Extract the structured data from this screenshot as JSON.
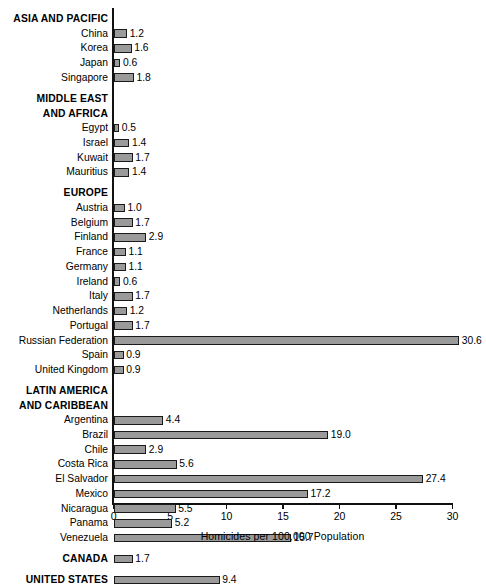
{
  "chart_data": {
    "type": "bar",
    "orientation": "horizontal",
    "title": "",
    "xlabel": "Homicides per 100,000 Population",
    "ylabel": "",
    "xlim": [
      0,
      30
    ],
    "xticks": [
      0,
      5,
      10,
      15,
      20,
      25,
      30
    ],
    "xtick_labels": [
      "0",
      "5",
      "10",
      "15",
      "20",
      "25",
      "30"
    ],
    "grid": false,
    "legend": null,
    "value_label_format": "one-decimal",
    "bar_color": "#9a9a9a",
    "bar_edge_color": "#1a1a1a",
    "axis_color": "#111111",
    "background": "#ffffff",
    "groups": [
      {
        "heading": "ASIA AND PACIFIC",
        "heading_lines": [
          "ASIA AND PACIFIC"
        ],
        "bold": true,
        "categories": [
          "China",
          "Korea",
          "Japan",
          "Singapore"
        ],
        "values": [
          1.2,
          1.6,
          0.6,
          1.8
        ]
      },
      {
        "heading": "MIDDLE EAST AND AFRICA",
        "heading_lines": [
          "MIDDLE EAST",
          "AND AFRICA"
        ],
        "bold": true,
        "categories": [
          "Egypt",
          "Israel",
          "Kuwait",
          "Mauritius"
        ],
        "values": [
          0.5,
          1.4,
          1.7,
          1.4
        ]
      },
      {
        "heading": "EUROPE",
        "heading_lines": [
          "EUROPE"
        ],
        "bold": true,
        "categories": [
          "Austria",
          "Belgium",
          "Finland",
          "France",
          "Germany",
          "Ireland",
          "Italy",
          "Netherlands",
          "Portugal",
          "Russian Federation",
          "Spain",
          "United Kingdom"
        ],
        "values": [
          1.0,
          1.7,
          2.9,
          1.1,
          1.1,
          0.6,
          1.7,
          1.2,
          1.7,
          30.6,
          0.9,
          0.9
        ]
      },
      {
        "heading": "LATIN AMERICA AND CARIBBEAN",
        "heading_lines": [
          "LATIN AMERICA",
          "AND CARIBBEAN"
        ],
        "bold": true,
        "categories": [
          "Argentina",
          "Brazil",
          "Chile",
          "Costa Rica",
          "El Salvador",
          "Mexico",
          "Nicaragua",
          "Panama",
          "Venezuela"
        ],
        "values": [
          4.4,
          19.0,
          2.9,
          5.6,
          27.4,
          17.2,
          5.5,
          5.2,
          15.7
        ]
      },
      {
        "heading": "",
        "heading_lines": [],
        "bold": true,
        "categories": [
          "CANADA"
        ],
        "values": [
          1.7
        ],
        "category_is_heading": true
      },
      {
        "heading": "",
        "heading_lines": [],
        "bold": true,
        "categories": [
          "UNITED STATES"
        ],
        "values": [
          9.4
        ],
        "category_is_heading": true
      }
    ],
    "categories": [
      "China",
      "Korea",
      "Japan",
      "Singapore",
      "Egypt",
      "Israel",
      "Kuwait",
      "Mauritius",
      "Austria",
      "Belgium",
      "Finland",
      "France",
      "Germany",
      "Ireland",
      "Italy",
      "Netherlands",
      "Portugal",
      "Russian Federation",
      "Spain",
      "United Kingdom",
      "Argentina",
      "Brazil",
      "Chile",
      "Costa Rica",
      "El Salvador",
      "Mexico",
      "Nicaragua",
      "Panama",
      "Venezuela",
      "CANADA",
      "UNITED STATES"
    ],
    "values": [
      1.2,
      1.6,
      0.6,
      1.8,
      0.5,
      1.4,
      1.7,
      1.4,
      1.0,
      1.7,
      2.9,
      1.1,
      1.1,
      0.6,
      1.7,
      1.2,
      1.7,
      30.6,
      0.9,
      0.9,
      4.4,
      19.0,
      2.9,
      5.6,
      27.4,
      17.2,
      5.5,
      5.2,
      15.7,
      1.7,
      9.4
    ]
  }
}
